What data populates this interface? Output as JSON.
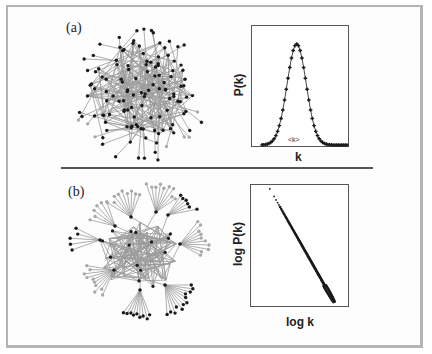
{
  "figure": {
    "panels": [
      {
        "label": "(a)",
        "network_type": "random",
        "chart": {
          "ylabel": "P(k)",
          "xlabel": "k",
          "annotation": "<k>"
        }
      },
      {
        "label": "(b)",
        "network_type": "scale-free",
        "chart": {
          "ylabel": "log P(k)",
          "xlabel": "log k"
        }
      }
    ]
  },
  "colors": {
    "frame": "#b4b4b4",
    "node_dark": "#1a1a1a",
    "node_light": "#a8a8a8",
    "edge": "#9a9a9a",
    "axis": "#555555",
    "marker": "#1a1a1a"
  },
  "chart_data": [
    {
      "type": "scatter",
      "title": "(a) Degree distribution of random network",
      "xlabel": "k",
      "ylabel": "P(k)",
      "annotations": [
        "<k>"
      ],
      "grid": false,
      "legend": "none",
      "description": "Poisson/bell-shaped distribution peaked at <k>, markers connected by a line",
      "x": [
        0,
        1,
        2,
        3,
        4,
        5,
        6,
        7,
        8,
        9,
        10,
        11,
        12,
        13,
        14,
        15,
        16,
        17,
        18,
        19,
        20,
        21,
        22,
        23,
        24,
        25,
        26,
        27,
        28,
        29,
        30,
        31,
        32,
        33,
        34,
        35,
        36,
        37,
        38,
        39,
        40,
        41,
        42,
        43,
        44,
        45,
        46,
        47,
        48,
        49
      ],
      "y_normalized_peak": 1.0,
      "peak_x": 20,
      "sigma": 5.5
    },
    {
      "type": "scatter",
      "title": "(b) Degree distribution of scale-free network",
      "xlabel": "log k",
      "ylabel": "log P(k)",
      "grid": false,
      "legend": "none",
      "description": "Power-law: straight line with negative slope on log-log axes, sparse points at top-left, dense at bottom-right",
      "x_range_normalized": [
        0.2,
        0.85
      ],
      "y_range_normalized": [
        0.96,
        0.04
      ],
      "n_points": 140
    }
  ]
}
